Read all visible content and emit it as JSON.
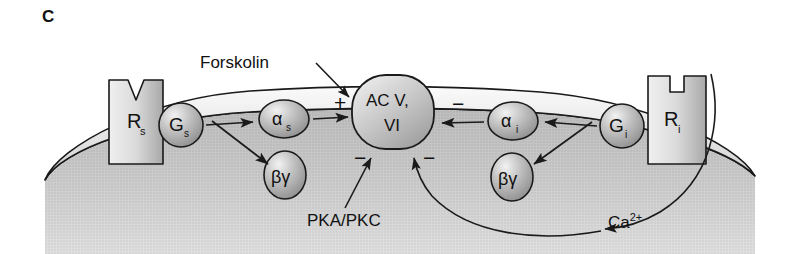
{
  "figure": {
    "panel_letter": "C",
    "type": "biological-signaling-pathway",
    "title_hidden": ""
  },
  "labels": {
    "forskolin": "Forskolin",
    "pka_pkc": "PKA/PKC",
    "calcium": "Ca",
    "calcium_charge": "2+"
  },
  "nodes": {
    "receptor_stimulatory": {
      "base": "R",
      "sub": "s",
      "full": "Rs",
      "shape": "rectangle-with-v-notch"
    },
    "receptor_inhibitory": {
      "base": "R",
      "sub": "i",
      "full": "Ri",
      "shape": "rectangle-with-square-notch"
    },
    "g_protein_stimulatory": {
      "base": "G",
      "sub": "s",
      "full": "Gs",
      "shape": "sphere"
    },
    "g_protein_inhibitory": {
      "base": "G",
      "sub": "i",
      "full": "Gi",
      "shape": "sphere"
    },
    "alpha_stimulatory": {
      "base": "α",
      "sub": "s",
      "full": "αs",
      "shape": "ellipse"
    },
    "alpha_inhibitory": {
      "base": "α",
      "sub": "i",
      "full": "αi",
      "shape": "ellipse"
    },
    "beta_gamma_left": {
      "full": "βγ",
      "shape": "ellipse"
    },
    "beta_gamma_right": {
      "full": "βγ",
      "shape": "ellipse"
    },
    "adenylyl_cyclase": {
      "line1": "AC V,",
      "line2": "VI",
      "full": "AC V, VI",
      "shape": "rounded-rectangle"
    }
  },
  "signs": {
    "activation_forskolin": "+",
    "inhibition_alpha_i": "−",
    "inhibition_pka_pkc": "−",
    "inhibition_calcium": "−"
  },
  "colors": {
    "outline": "#1a1a1a",
    "membrane_fill": "#e6e6e6",
    "cytoplasm_fill": "#c9c9c9",
    "node_fill": "#b4b4b4",
    "background": "#ffffff",
    "text": "#111111"
  }
}
